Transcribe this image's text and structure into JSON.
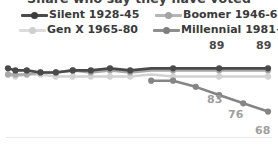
{
  "title": {
    "text": "Share who say they have voted",
    "clipped": true
  },
  "legend": {
    "items": [
      {
        "label": "Silent 1928-45",
        "color": "#4a4a4a",
        "icon": "line-marker-icon"
      },
      {
        "label": "Boomer 1946-64",
        "color": "#a8a8a8",
        "icon": "line-marker-icon"
      },
      {
        "label": "Gen X 1965-80",
        "color": "#d2d2d2",
        "icon": "line-marker-icon"
      },
      {
        "label": "Millennial 1981+",
        "color": "#858585",
        "icon": "line-marker-icon"
      }
    ]
  },
  "chart_data": {
    "type": "line",
    "title": "Share who say they have voted",
    "xlabel": "",
    "ylabel": "",
    "ylim": [
      60,
      95
    ],
    "grid": false,
    "legend_position": "top",
    "x": [
      0,
      1,
      2,
      3,
      4,
      5,
      6,
      7,
      8,
      9,
      10,
      11,
      12,
      13,
      14
    ],
    "series": [
      {
        "name": "Silent 1928-45",
        "color": "#4a4a4a",
        "values": [
          89,
          88,
          88,
          87,
          87,
          88,
          88,
          89,
          88,
          89,
          89,
          89,
          89,
          89,
          89
        ],
        "labels": {
          "9": "89",
          "14": "89"
        }
      },
      {
        "name": "Boomer 1946-64",
        "color": "#a8a8a8",
        "values": [
          86,
          86,
          86,
          87,
          87,
          88,
          87,
          88,
          87,
          88,
          88,
          88,
          88,
          88,
          88
        ],
        "labels": {}
      },
      {
        "name": "Gen X 1965-80",
        "color": "#d2d2d2",
        "values": [
          86,
          85,
          86,
          86,
          85,
          85,
          85,
          85,
          85,
          86,
          85,
          85,
          85,
          85,
          85
        ],
        "labels": {}
      },
      {
        "name": "Millennial 1981+",
        "color": "#858585",
        "values": [
          null,
          null,
          null,
          null,
          null,
          null,
          null,
          null,
          null,
          83,
          83,
          80,
          76,
          72,
          68
        ],
        "labels": {
          "10": "83",
          "12": "76",
          "14": "68"
        }
      }
    ],
    "data_labels": [
      {
        "text": "89",
        "series": "Silent 1928-45",
        "value": 89,
        "color": "#4a4a4a"
      },
      {
        "text": "89",
        "series": "Silent 1928-45",
        "value": 89,
        "color": "#4a4a4a"
      },
      {
        "text": "83",
        "series": "Millennial 1981+",
        "value": 83,
        "color": "#9a9a9a"
      },
      {
        "text": "76",
        "series": "Millennial 1981+",
        "value": 76,
        "color": "#9a9a9a"
      },
      {
        "text": "68",
        "series": "Millennial 1981+",
        "value": 68,
        "color": "#9a9a9a"
      }
    ]
  },
  "labels": {
    "silent_left": "89",
    "silent_right": "89",
    "millennial_83": "83",
    "millennial_76": "76",
    "millennial_68": "68"
  }
}
